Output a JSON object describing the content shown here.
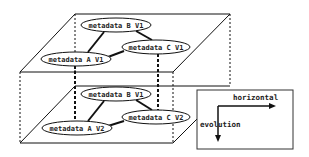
{
  "diagram": {
    "layers": [
      {
        "name": "top-layer",
        "nodes": [
          {
            "id": "B1",
            "label": "metadata B V1",
            "cx": 116,
            "cy": 25,
            "rx": 35,
            "ry": 7
          },
          {
            "id": "C1",
            "label": "metadata C V1",
            "cx": 156,
            "cy": 47,
            "rx": 34,
            "ry": 7
          },
          {
            "id": "A1",
            "label": "metadata A V1",
            "cx": 76,
            "cy": 59,
            "rx": 35,
            "ry": 7
          }
        ],
        "edges": [
          [
            "A1",
            "B1"
          ],
          [
            "B1",
            "C1"
          ],
          [
            "A1",
            "C1"
          ]
        ]
      },
      {
        "name": "bottom-layer",
        "nodes": [
          {
            "id": "B2",
            "label": "metadata B V1",
            "cx": 116,
            "cy": 94,
            "rx": 35,
            "ry": 7
          },
          {
            "id": "C2",
            "label": "metadata C V2",
            "cx": 156,
            "cy": 117,
            "rx": 34,
            "ry": 7
          },
          {
            "id": "A2",
            "label": "metadata A V2",
            "cx": 77,
            "cy": 128,
            "rx": 35,
            "ry": 7
          }
        ],
        "edges": [
          [
            "A2",
            "B2"
          ],
          [
            "B2",
            "C2"
          ],
          [
            "A2",
            "C2"
          ]
        ]
      }
    ],
    "legend": {
      "horizontal_label": "horizontal",
      "evolution_label": "evolution"
    },
    "colors": {
      "line": "#111111",
      "dashed": "#222222",
      "ellipse_fill": "#ffffff",
      "background": "#ffffff"
    }
  }
}
